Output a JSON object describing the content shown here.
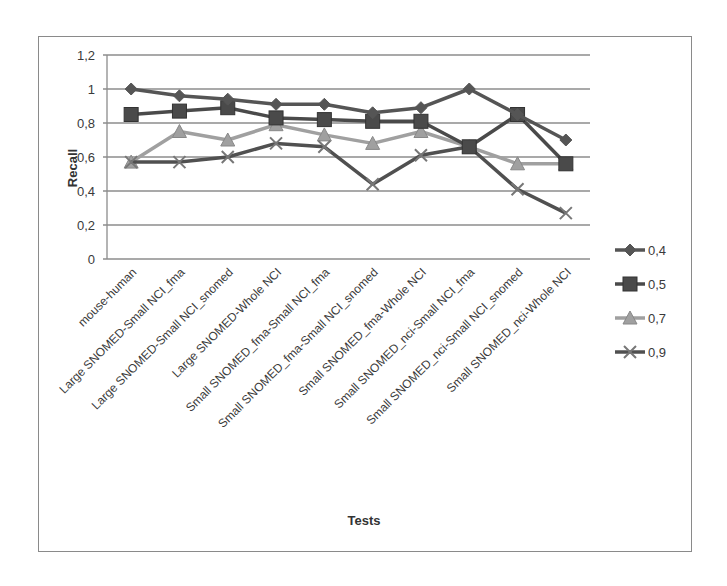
{
  "chart_data": {
    "type": "line",
    "title": "",
    "xlabel": "Tests",
    "ylabel": "Recall",
    "ylim": [
      0,
      1.2
    ],
    "yticks": [
      "0",
      "0,2",
      "0,4",
      "0,6",
      "0,8",
      "1",
      "1,2"
    ],
    "grid": true,
    "legend_position": "right",
    "categories": [
      "mouse-human",
      "Large SNOMED-Small NCI_fma",
      "Large SNOMED-Small NCI_snomed",
      "Large SNOMED-Whole NCI",
      "Small SNOMED_fma-Small NCI_fma",
      "Small SNOMED_fma-Small NCI_snomed",
      "Small SNOMED_fma-Whole NCI",
      "Small SNOMED_nci-Small NCI_fma",
      "Small SNOMED_nci-Small NCI_snomed",
      "Small SNOMED_nci-Whole NCI"
    ],
    "series": [
      {
        "name": "0,4",
        "marker": "diamond",
        "color": "#555555",
        "values": [
          1.0,
          0.96,
          0.94,
          0.91,
          0.91,
          0.86,
          0.89,
          1.0,
          0.85,
          0.7
        ]
      },
      {
        "name": "0,5",
        "marker": "square",
        "color": "#4a4a4a",
        "values": [
          0.85,
          0.87,
          0.89,
          0.83,
          0.82,
          0.81,
          0.81,
          0.66,
          0.85,
          0.56
        ]
      },
      {
        "name": "0,7",
        "marker": "triangle",
        "color": "#a0a0a0",
        "values": [
          0.57,
          0.75,
          0.7,
          0.79,
          0.73,
          0.68,
          0.75,
          0.66,
          0.56,
          0.56
        ]
      },
      {
        "name": "0,9",
        "marker": "x",
        "color": "#505050",
        "values": [
          0.57,
          0.57,
          0.6,
          0.68,
          0.66,
          0.44,
          0.61,
          0.66,
          0.41,
          0.27
        ]
      }
    ]
  }
}
